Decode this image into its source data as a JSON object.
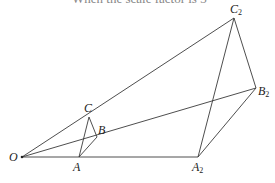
{
  "header": {
    "cropped_text": "When the scale factor is 3"
  },
  "diagram": {
    "points": {
      "O": {
        "x": 22,
        "y": 157,
        "label": "O",
        "sub": ""
      },
      "A": {
        "x": 79,
        "y": 157,
        "label": "A",
        "sub": ""
      },
      "B": {
        "x": 97,
        "y": 137,
        "label": "B",
        "sub": ""
      },
      "C": {
        "x": 89,
        "y": 117,
        "label": "C",
        "sub": ""
      },
      "A2": {
        "x": 198,
        "y": 157,
        "label": "A",
        "sub": "2"
      },
      "B2": {
        "x": 256,
        "y": 88,
        "label": "B",
        "sub": "2"
      },
      "C2": {
        "x": 234,
        "y": 18,
        "label": "C",
        "sub": "2"
      }
    },
    "rays": [
      [
        "O",
        "A2"
      ],
      [
        "O",
        "B2"
      ],
      [
        "O",
        "C2"
      ]
    ],
    "triangles": [
      [
        "A",
        "B",
        "C"
      ],
      [
        "A2",
        "B2",
        "C2"
      ]
    ],
    "stroke_color": "#3a3a3a"
  }
}
